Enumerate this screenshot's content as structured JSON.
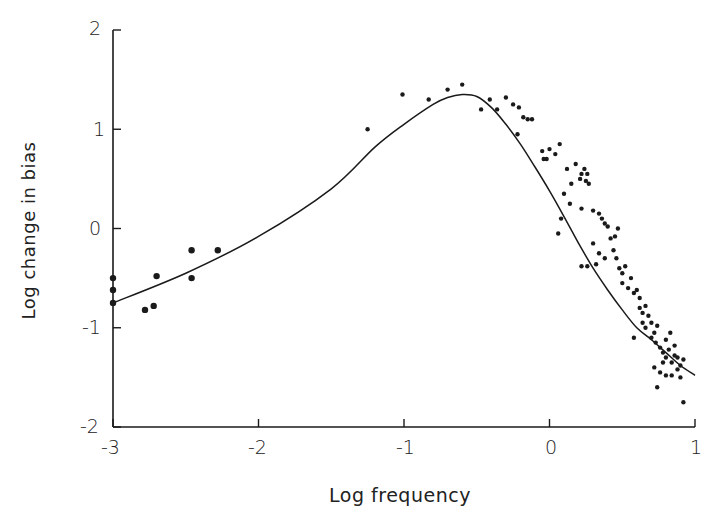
{
  "chart_data": {
    "type": "scatter",
    "title": "",
    "xlabel": "Log frequency",
    "ylabel": "Log change in bias",
    "xlim": [
      -3,
      1
    ],
    "ylim": [
      -2,
      2
    ],
    "xticks": [
      -3,
      -2,
      -1,
      0,
      1
    ],
    "yticks": [
      -2,
      -1,
      0,
      1,
      2
    ],
    "xtick_labels": [
      "-3",
      "-2",
      "-1",
      "0",
      "1"
    ],
    "ytick_labels": [
      "-2",
      "-1",
      "0",
      "1",
      "2"
    ],
    "grid": false,
    "legend": null,
    "series": [
      {
        "name": "observed",
        "kind": "scatter",
        "points": [
          [
            -3.0,
            -0.5
          ],
          [
            -3.0,
            -0.62
          ],
          [
            -3.0,
            -0.75
          ],
          [
            -2.78,
            -0.82
          ],
          [
            -2.72,
            -0.78
          ],
          [
            -2.7,
            -0.48
          ],
          [
            -2.46,
            -0.22
          ],
          [
            -2.46,
            -0.5
          ],
          [
            -2.28,
            -0.22
          ],
          [
            -1.25,
            1.0
          ],
          [
            -1.01,
            1.35
          ],
          [
            -0.83,
            1.3
          ],
          [
            -0.7,
            1.4
          ],
          [
            -0.6,
            1.45
          ],
          [
            -0.47,
            1.2
          ],
          [
            -0.41,
            1.3
          ],
          [
            -0.36,
            1.2
          ],
          [
            -0.3,
            1.32
          ],
          [
            -0.25,
            1.25
          ],
          [
            -0.21,
            1.22
          ],
          [
            -0.18,
            1.12
          ],
          [
            -0.15,
            1.1
          ],
          [
            -0.12,
            1.1
          ],
          [
            -0.22,
            0.95
          ],
          [
            -0.05,
            0.78
          ],
          [
            -0.04,
            0.7
          ],
          [
            -0.02,
            0.7
          ],
          [
            0.0,
            0.8
          ],
          [
            0.04,
            0.75
          ],
          [
            0.07,
            0.85
          ],
          [
            0.12,
            0.6
          ],
          [
            0.18,
            0.65
          ],
          [
            0.22,
            0.55
          ],
          [
            0.24,
            0.6
          ],
          [
            0.26,
            0.55
          ],
          [
            0.15,
            0.45
          ],
          [
            0.21,
            0.5
          ],
          [
            0.25,
            0.48
          ],
          [
            0.27,
            0.45
          ],
          [
            0.1,
            0.35
          ],
          [
            0.08,
            0.1
          ],
          [
            0.06,
            -0.05
          ],
          [
            0.14,
            0.25
          ],
          [
            0.22,
            0.2
          ],
          [
            0.3,
            0.18
          ],
          [
            0.34,
            0.15
          ],
          [
            0.36,
            0.1
          ],
          [
            0.38,
            0.05
          ],
          [
            0.4,
            0.02
          ],
          [
            0.42,
            -0.1
          ],
          [
            0.45,
            -0.08
          ],
          [
            0.47,
            0.0
          ],
          [
            0.3,
            -0.15
          ],
          [
            0.34,
            -0.25
          ],
          [
            0.38,
            -0.3
          ],
          [
            0.44,
            -0.22
          ],
          [
            0.46,
            -0.3
          ],
          [
            0.26,
            -0.38
          ],
          [
            0.22,
            -0.38
          ],
          [
            0.32,
            -0.36
          ],
          [
            0.48,
            -0.4
          ],
          [
            0.5,
            -0.45
          ],
          [
            0.52,
            -0.38
          ],
          [
            0.5,
            -0.55
          ],
          [
            0.54,
            -0.6
          ],
          [
            0.56,
            -0.5
          ],
          [
            0.58,
            -0.65
          ],
          [
            0.6,
            -0.62
          ],
          [
            0.62,
            -0.7
          ],
          [
            0.62,
            -0.8
          ],
          [
            0.64,
            -0.85
          ],
          [
            0.66,
            -0.78
          ],
          [
            0.68,
            -0.88
          ],
          [
            0.64,
            -0.95
          ],
          [
            0.66,
            -1.0
          ],
          [
            0.7,
            -0.95
          ],
          [
            0.72,
            -1.05
          ],
          [
            0.74,
            -0.98
          ],
          [
            0.7,
            -1.1
          ],
          [
            0.73,
            -1.15
          ],
          [
            0.76,
            -1.2
          ],
          [
            0.78,
            -1.25
          ],
          [
            0.8,
            -1.12
          ],
          [
            0.8,
            -1.3
          ],
          [
            0.82,
            -1.22
          ],
          [
            0.84,
            -1.35
          ],
          [
            0.86,
            -1.28
          ],
          [
            0.88,
            -1.3
          ],
          [
            0.9,
            -1.38
          ],
          [
            0.92,
            -1.32
          ],
          [
            0.76,
            -1.45
          ],
          [
            0.8,
            -1.48
          ],
          [
            0.84,
            -1.48
          ],
          [
            0.88,
            -1.42
          ],
          [
            0.9,
            -1.5
          ],
          [
            0.72,
            -1.4
          ],
          [
            0.74,
            -1.6
          ],
          [
            0.92,
            -1.75
          ],
          [
            0.58,
            -1.1
          ],
          [
            0.86,
            -1.18
          ],
          [
            0.83,
            -1.05
          ],
          [
            0.78,
            -1.35
          ]
        ]
      },
      {
        "name": "fitted curve",
        "kind": "line",
        "points": [
          [
            -3.0,
            -0.75
          ],
          [
            -2.5,
            -0.45
          ],
          [
            -2.0,
            -0.08
          ],
          [
            -1.5,
            0.4
          ],
          [
            -1.2,
            0.82
          ],
          [
            -1.0,
            1.05
          ],
          [
            -0.8,
            1.25
          ],
          [
            -0.7,
            1.32
          ],
          [
            -0.6,
            1.35
          ],
          [
            -0.5,
            1.33
          ],
          [
            -0.4,
            1.22
          ],
          [
            -0.3,
            1.05
          ],
          [
            -0.2,
            0.85
          ],
          [
            -0.1,
            0.62
          ],
          [
            0.0,
            0.38
          ],
          [
            0.1,
            0.12
          ],
          [
            0.2,
            -0.15
          ],
          [
            0.3,
            -0.4
          ],
          [
            0.4,
            -0.62
          ],
          [
            0.5,
            -0.82
          ],
          [
            0.6,
            -1.0
          ],
          [
            0.7,
            -1.12
          ],
          [
            0.8,
            -1.25
          ],
          [
            0.9,
            -1.38
          ],
          [
            1.0,
            -1.48
          ]
        ]
      }
    ]
  },
  "axes": {
    "xlabel": "Log frequency",
    "ylabel": "Log change in bias",
    "xtick_labels": [
      "-3",
      "-2",
      "-1",
      "0",
      "1"
    ],
    "ytick_labels": [
      "2",
      "1",
      "0",
      "-1",
      "-2"
    ]
  },
  "colors": {
    "ink": "#1a1a1a",
    "background": "#ffffff"
  }
}
